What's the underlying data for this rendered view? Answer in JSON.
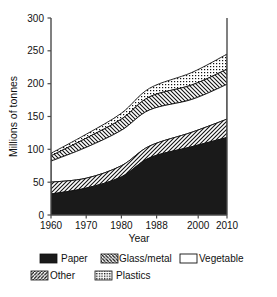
{
  "chart_data": {
    "type": "area",
    "title": "",
    "subtitle": "",
    "xlabel": "Year",
    "ylabel": "Millions of tonnes",
    "xlim": [
      1960,
      2010
    ],
    "ylim": [
      0,
      300
    ],
    "grid": false,
    "stacked": true,
    "legend_position": "bottom",
    "x": [
      1960,
      1970,
      1980,
      1988,
      2000,
      2010
    ],
    "xtick_labels": [
      "1960",
      "1970",
      "1980",
      "1988",
      "2000",
      "2010"
    ],
    "ytick_labels": [
      "0",
      "50",
      "100",
      "150",
      "200",
      "250",
      "300"
    ],
    "ytick_values": [
      0,
      50,
      100,
      150,
      200,
      250,
      300
    ],
    "series": [
      {
        "name": "Paper",
        "pattern": "solid-black",
        "values": [
          32,
          41,
          58,
          87,
          104,
          118
        ]
      },
      {
        "name": "Other",
        "pattern": "forward-hatch",
        "values": [
          18,
          15,
          17,
          18,
          22,
          28
        ]
      },
      {
        "name": "Vegetable",
        "pattern": "white",
        "values": [
          32,
          47,
          54,
          55,
          50,
          53
        ]
      },
      {
        "name": "Glass/metal",
        "pattern": "back-hatch",
        "values": [
          8,
          14,
          17,
          20,
          22,
          23
        ]
      },
      {
        "name": "Plastics",
        "pattern": "dotted",
        "values": [
          4,
          6,
          9,
          13,
          19,
          23
        ]
      }
    ],
    "cumulative_tops": {
      "Paper": [
        32,
        41,
        58,
        87,
        104,
        118
      ],
      "Other": [
        50,
        56,
        75,
        105,
        126,
        146
      ],
      "Vegetable": [
        82,
        103,
        129,
        160,
        176,
        199
      ],
      "Glass/metal": [
        90,
        117,
        146,
        180,
        198,
        222
      ],
      "Plastics": [
        94,
        123,
        155,
        193,
        217,
        245
      ]
    }
  },
  "legend": {
    "items": [
      {
        "label": "Paper",
        "swatch": "solid-black"
      },
      {
        "label": "Glass/metal",
        "swatch": "back-hatch"
      },
      {
        "label": "Vegetable",
        "swatch": "white"
      },
      {
        "label": "Other",
        "swatch": "forward-hatch"
      },
      {
        "label": "Plastics",
        "swatch": "dotted"
      }
    ]
  },
  "axes": {
    "y_title": "Millions of tonnes",
    "x_title": "Year",
    "y_ticks": [
      "300",
      "250",
      "200",
      "150",
      "100",
      "50",
      "0"
    ],
    "x_ticks": [
      "1960",
      "1970",
      "1980",
      "1988",
      "2000",
      "2010"
    ]
  }
}
